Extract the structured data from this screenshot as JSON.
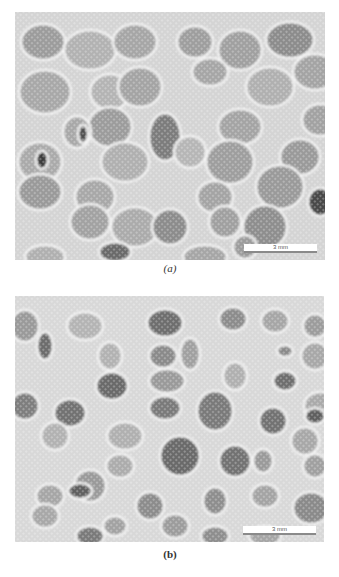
{
  "figure": {
    "panels": [
      {
        "id": "a",
        "caption": "(a)",
        "caption_style": "italic",
        "scale_bar_label": "3 mm",
        "box": {
          "x": 15,
          "y": 12,
          "w": 310,
          "h": 248
        },
        "scale_bar": {
          "x": 244,
          "y": 244,
          "w": 73,
          "h": 9
        },
        "caption_pos": {
          "x": 140,
          "y": 262
        },
        "background": "#d4d4d4",
        "cells": [
          [
            28,
            30,
            22,
            18,
            "#9c9c9c"
          ],
          [
            75,
            38,
            26,
            20,
            "#b2b2b2"
          ],
          [
            120,
            30,
            22,
            18,
            "#a6a6a6"
          ],
          [
            180,
            30,
            18,
            16,
            "#9e9e9e"
          ],
          [
            225,
            38,
            22,
            20,
            "#a0a0a0"
          ],
          [
            275,
            28,
            24,
            18,
            "#8c8c8c"
          ],
          [
            300,
            60,
            22,
            18,
            "#a4a4a4"
          ],
          [
            30,
            80,
            26,
            22,
            "#a8a8a8"
          ],
          [
            95,
            80,
            20,
            18,
            "#b4b4b4"
          ],
          [
            125,
            75,
            22,
            20,
            "#a4a4a4"
          ],
          [
            195,
            60,
            18,
            14,
            "#a6a6a6"
          ],
          [
            255,
            75,
            24,
            20,
            "#b0b0b0"
          ],
          [
            305,
            108,
            18,
            16,
            "#a2a2a2"
          ],
          [
            95,
            115,
            22,
            20,
            "#9c9c9c"
          ],
          [
            62,
            120,
            14,
            16,
            "#a8a8a8"
          ],
          [
            68,
            122,
            5,
            9,
            "#505050"
          ],
          [
            150,
            125,
            16,
            24,
            "#7c7c7c"
          ],
          [
            225,
            115,
            22,
            18,
            "#a4a4a4"
          ],
          [
            285,
            145,
            20,
            18,
            "#9a9a9a"
          ],
          [
            25,
            150,
            22,
            20,
            "#aaaaaa"
          ],
          [
            27,
            148,
            6,
            9,
            "#3c3c3c"
          ],
          [
            110,
            150,
            24,
            20,
            "#b0b0b0"
          ],
          [
            215,
            150,
            24,
            22,
            "#9e9e9e"
          ],
          [
            175,
            140,
            16,
            16,
            "#b6b6b6"
          ],
          [
            25,
            180,
            22,
            18,
            "#9a9a9a"
          ],
          [
            80,
            185,
            20,
            18,
            "#a8a8a8"
          ],
          [
            200,
            185,
            18,
            16,
            "#a4a4a4"
          ],
          [
            265,
            175,
            24,
            22,
            "#9a9a9a"
          ],
          [
            75,
            210,
            20,
            18,
            "#a2a2a2"
          ],
          [
            120,
            215,
            24,
            20,
            "#ababab"
          ],
          [
            155,
            215,
            18,
            18,
            "#8c8c8c"
          ],
          [
            210,
            210,
            16,
            16,
            "#a0a0a0"
          ],
          [
            250,
            215,
            22,
            22,
            "#8e8e8e"
          ],
          [
            305,
            190,
            12,
            14,
            "#4a4a4a"
          ],
          [
            100,
            240,
            16,
            10,
            "#6a6a6a"
          ],
          [
            30,
            245,
            20,
            12,
            "#b0b0b0"
          ],
          [
            190,
            245,
            22,
            12,
            "#a6a6a6"
          ],
          [
            230,
            235,
            12,
            12,
            "#9c9c9c"
          ],
          [
            320,
            245,
            6,
            14,
            "#3a3a3a"
          ]
        ]
      },
      {
        "id": "b",
        "caption": "(b)",
        "caption_style": "bold",
        "scale_bar_label": "3 mm",
        "box": {
          "x": 15,
          "y": 296,
          "w": 309,
          "h": 246
        },
        "scale_bar": {
          "x": 243,
          "y": 526,
          "w": 73,
          "h": 9
        },
        "caption_pos": {
          "x": 140,
          "y": 548
        },
        "background": "#d8d8d8",
        "cells": [
          [
            10,
            30,
            14,
            16,
            "#9a9a9a"
          ],
          [
            70,
            30,
            18,
            14,
            "#b4b4b4"
          ],
          [
            150,
            27,
            18,
            14,
            "#6e6e6e"
          ],
          [
            218,
            23,
            14,
            12,
            "#8c8c8c"
          ],
          [
            260,
            25,
            14,
            12,
            "#a6a6a6"
          ],
          [
            300,
            30,
            12,
            12,
            "#9c9c9c"
          ],
          [
            30,
            50,
            8,
            14,
            "#6c6c6c"
          ],
          [
            95,
            60,
            12,
            14,
            "#b2b2b2"
          ],
          [
            148,
            60,
            14,
            12,
            "#8a8a8a"
          ],
          [
            175,
            58,
            10,
            16,
            "#a0a0a0"
          ],
          [
            270,
            55,
            8,
            6,
            "#8a8a8a"
          ],
          [
            300,
            60,
            14,
            14,
            "#a8a8a8"
          ],
          [
            97,
            90,
            16,
            14,
            "#6a6a6a"
          ],
          [
            152,
            85,
            18,
            12,
            "#9a9a9a"
          ],
          [
            220,
            80,
            12,
            14,
            "#b0b0b0"
          ],
          [
            270,
            85,
            12,
            10,
            "#6e6e6e"
          ],
          [
            305,
            110,
            16,
            14,
            "#aaaaaa"
          ],
          [
            10,
            110,
            14,
            14,
            "#7e7e7e"
          ],
          [
            55,
            117,
            16,
            14,
            "#727272"
          ],
          [
            150,
            112,
            16,
            12,
            "#7a7a7a"
          ],
          [
            200,
            115,
            18,
            20,
            "#7a7a7a"
          ],
          [
            258,
            125,
            14,
            14,
            "#727272"
          ],
          [
            300,
            120,
            10,
            8,
            "#5e5e5e"
          ],
          [
            40,
            140,
            14,
            14,
            "#b2b2b2"
          ],
          [
            110,
            140,
            18,
            14,
            "#b0b0b0"
          ],
          [
            290,
            145,
            14,
            14,
            "#a8a8a8"
          ],
          [
            165,
            160,
            20,
            20,
            "#6a6a6a"
          ],
          [
            220,
            165,
            16,
            16,
            "#727272"
          ],
          [
            105,
            170,
            14,
            12,
            "#acacac"
          ],
          [
            248,
            165,
            10,
            12,
            "#9a9a9a"
          ],
          [
            300,
            170,
            12,
            12,
            "#a0a0a0"
          ],
          [
            75,
            190,
            16,
            16,
            "#9a9a9a"
          ],
          [
            35,
            200,
            14,
            12,
            "#a6a6a6"
          ],
          [
            65,
            195,
            12,
            8,
            "#606060"
          ],
          [
            135,
            210,
            14,
            14,
            "#8c8c8c"
          ],
          [
            200,
            205,
            12,
            14,
            "#8e8e8e"
          ],
          [
            250,
            200,
            14,
            12,
            "#a4a4a4"
          ],
          [
            296,
            212,
            18,
            16,
            "#8a8a8a"
          ],
          [
            30,
            220,
            14,
            12,
            "#a8a8a8"
          ],
          [
            100,
            230,
            12,
            10,
            "#a2a2a2"
          ],
          [
            160,
            230,
            14,
            12,
            "#9c9c9c"
          ],
          [
            75,
            240,
            14,
            10,
            "#7a7a7a"
          ],
          [
            200,
            240,
            14,
            10,
            "#8e8e8e"
          ],
          [
            250,
            240,
            16,
            10,
            "#a6a6a6"
          ]
        ]
      }
    ]
  }
}
